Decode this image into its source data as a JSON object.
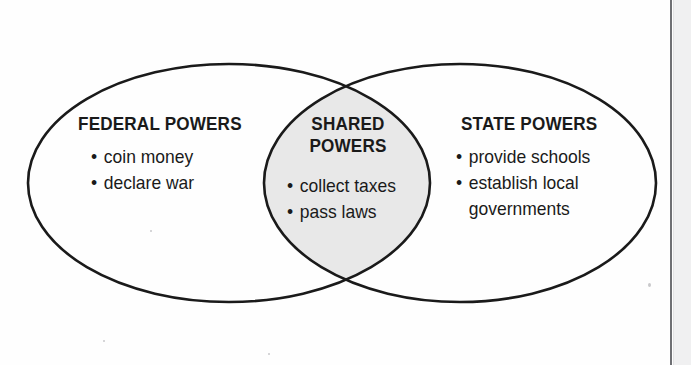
{
  "diagram": {
    "type": "venn-diagram",
    "fill_shared": "#e8e8e8",
    "stroke": "#1a1a1a",
    "background": "#fefefe",
    "left_set": {
      "heading": "FEDERAL POWERS",
      "items": [
        {
          "text": "coin money",
          "bullet": "•"
        },
        {
          "text": "declare war",
          "bullet": "•"
        }
      ]
    },
    "center_set": {
      "heading_line1": "SHARED",
      "heading_line2": "POWERS",
      "items": [
        {
          "text": "collect taxes",
          "bullet": "•"
        },
        {
          "text": "pass laws",
          "bullet": "•"
        }
      ]
    },
    "right_set": {
      "heading": "STATE POWERS",
      "items": [
        {
          "text": "provide schools",
          "bullet": "•"
        },
        {
          "text": "establish local",
          "text2": "governments",
          "bullet": "•"
        }
      ]
    }
  }
}
